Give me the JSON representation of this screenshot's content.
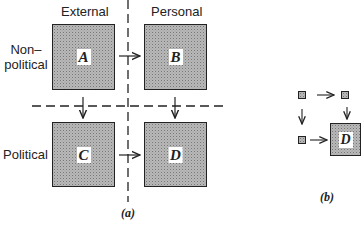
{
  "figure_a": {
    "column_headers": [
      "External",
      "Personal"
    ],
    "row_labels": [
      "Non-\npolitical",
      "Political"
    ],
    "row_label_lines": [
      [
        "Non–",
        "political"
      ],
      [
        "Political"
      ]
    ],
    "boxes": [
      "A",
      "B",
      "C",
      "D"
    ],
    "caption": "(a)"
  },
  "figure_b": {
    "box_label": "D",
    "caption": "(b)"
  },
  "colors": {
    "box_fill": "#b8b8b8",
    "stroke": "#222222"
  }
}
